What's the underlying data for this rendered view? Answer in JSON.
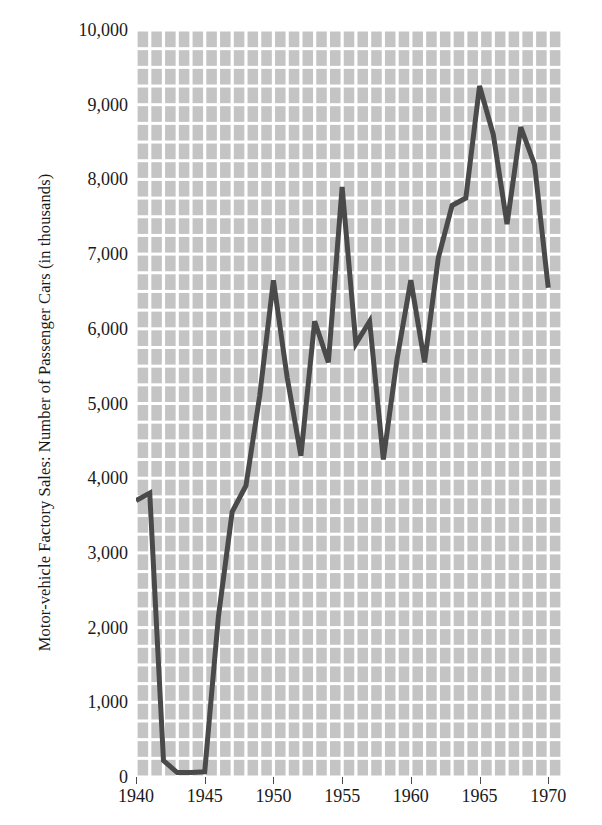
{
  "chart_data": {
    "type": "line",
    "title": "",
    "xlabel": "",
    "ylabel": "Motor-vehicle Factory Sales: Number of Passenger Cars (in thousands)",
    "xlim": [
      1940,
      1971
    ],
    "ylim": [
      0,
      10000
    ],
    "grid": true,
    "grid_x_step": 1,
    "grid_y_step": 250,
    "legend": "none",
    "line_color": "#4a4a4a",
    "plot_background": "#c4c4c4",
    "gridline_color": "#ffffff",
    "y_ticks": [
      {
        "value": 10000,
        "label": "10,000"
      },
      {
        "value": 9000,
        "label": "9,000"
      },
      {
        "value": 8000,
        "label": "8,000"
      },
      {
        "value": 7000,
        "label": "7,000"
      },
      {
        "value": 6000,
        "label": "6,000"
      },
      {
        "value": 5000,
        "label": "5,000"
      },
      {
        "value": 4000,
        "label": "4,000"
      },
      {
        "value": 3000,
        "label": "3,000"
      },
      {
        "value": 2000,
        "label": "2,000"
      },
      {
        "value": 1000,
        "label": "1,000"
      },
      {
        "value": 0,
        "label": "0"
      }
    ],
    "x_ticks": [
      {
        "value": 1940,
        "label": "1940"
      },
      {
        "value": 1945,
        "label": "1945"
      },
      {
        "value": 1950,
        "label": "1950"
      },
      {
        "value": 1955,
        "label": "1955"
      },
      {
        "value": 1960,
        "label": "1960"
      },
      {
        "value": 1965,
        "label": "1965"
      },
      {
        "value": 1970,
        "label": "1970"
      }
    ],
    "x": [
      1940,
      1941,
      1942,
      1943,
      1944,
      1945,
      1946,
      1947,
      1948,
      1949,
      1950,
      1951,
      1952,
      1953,
      1954,
      1955,
      1956,
      1957,
      1958,
      1959,
      1960,
      1961,
      1962,
      1963,
      1964,
      1965,
      1966,
      1967,
      1968,
      1969,
      1970
    ],
    "values": [
      3700,
      3800,
      220,
      60,
      60,
      70,
      2150,
      3550,
      3900,
      5100,
      6650,
      5350,
      4300,
      6100,
      5550,
      7900,
      5800,
      6100,
      4250,
      5600,
      6650,
      5550,
      6950,
      7650,
      7750,
      9250,
      8600,
      7400,
      8700,
      8200,
      6550
    ],
    "series_name": "Passenger cars"
  }
}
